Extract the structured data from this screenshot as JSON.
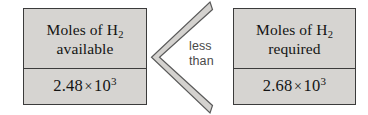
{
  "diagram": {
    "type": "comparison",
    "relation": {
      "symbol": "less-than-chevron",
      "line1": "less",
      "line2": "than"
    },
    "boxes": [
      {
        "side": "left",
        "label_line1_pre": "Moles of H",
        "label_line1_sub": "2",
        "label_line2": "available",
        "value_mantissa": "2.48",
        "value_times": "×",
        "value_base": "10",
        "value_exponent": "3"
      },
      {
        "side": "right",
        "label_line1_pre": "Moles of H",
        "label_line1_sub": "2",
        "label_line2": "required",
        "value_mantissa": "2.68",
        "value_times": "×",
        "value_base": "10",
        "value_exponent": "3"
      }
    ],
    "colors": {
      "box_fill": "#d6d4d1",
      "box_border": "#3b3b3b",
      "text": "#141414",
      "relation_text": "#4a4a4a",
      "chevron_fill": "#d4d2cf",
      "chevron_stroke": "#5a5a5a",
      "background": "#ffffff"
    }
  }
}
